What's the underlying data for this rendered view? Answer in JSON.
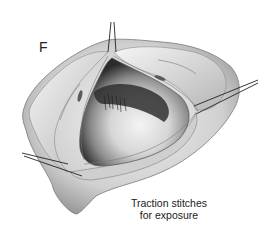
{
  "figure": {
    "panel_label": "F",
    "caption_line1": "Traction stitches",
    "caption_line2": "for exposure"
  },
  "illustration": {
    "subject": "opened tissue with exposed cavity held by traction stitches",
    "stitch_count": 3,
    "palette": {
      "background": "#ffffff",
      "tissue_light": "#e8e8e8",
      "tissue_mid": "#bdbdbd",
      "tissue_dark": "#6e6e6e",
      "cavity_dark": "#2b2b2b",
      "suture": "#222222"
    }
  }
}
